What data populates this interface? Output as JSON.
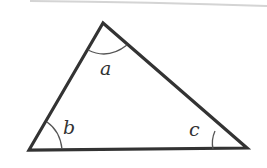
{
  "diagram": {
    "type": "triangle",
    "colors": {
      "stroke": "#333333",
      "arc": "#555555",
      "label": "#333333",
      "page_edge": "#cfcfcf"
    },
    "vertices": {
      "top": [
        103,
        23
      ],
      "bottom_left": [
        29,
        150
      ],
      "bottom_right": [
        247,
        148
      ]
    },
    "angles": [
      {
        "vertex": "top",
        "label": "a"
      },
      {
        "vertex": "bottom_left",
        "label": "b"
      },
      {
        "vertex": "bottom_right",
        "label": "c"
      }
    ]
  }
}
